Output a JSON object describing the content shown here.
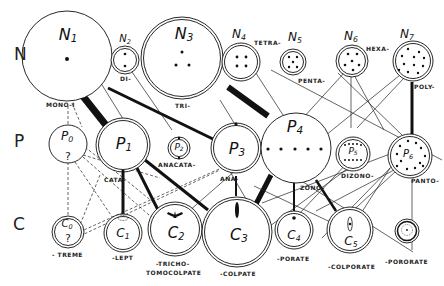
{
  "diagram": {
    "rows": [
      {
        "key": "N",
        "label": "N",
        "meaning": "number of apertures"
      },
      {
        "key": "P",
        "label": "P",
        "meaning": "position of apertures"
      },
      {
        "key": "C",
        "label": "C",
        "meaning": "character of apertures"
      }
    ],
    "nodes": {
      "N": [
        {
          "id": "N1",
          "letter": "N",
          "sub": "1",
          "prefix": "MONO-I"
        },
        {
          "id": "N2",
          "letter": "N",
          "sub": "2",
          "prefix": "DI-"
        },
        {
          "id": "N3",
          "letter": "N",
          "sub": "3",
          "prefix": "TRI-"
        },
        {
          "id": "N4",
          "letter": "N",
          "sub": "4",
          "prefix": "TETRA-"
        },
        {
          "id": "N5",
          "letter": "N",
          "sub": "5",
          "prefix": "PENTA-"
        },
        {
          "id": "N6",
          "letter": "N",
          "sub": "6",
          "prefix": "HEXA-"
        },
        {
          "id": "N7",
          "letter": "N",
          "sub": "7",
          "prefix": "POLY-"
        }
      ],
      "P": [
        {
          "id": "P0",
          "letter": "P",
          "sub": "0",
          "prefix": "",
          "mark": "?"
        },
        {
          "id": "P1",
          "letter": "P",
          "sub": "1",
          "prefix": "CATA-"
        },
        {
          "id": "P2",
          "letter": "P",
          "sub": "2",
          "prefix": "ANACATA-"
        },
        {
          "id": "P3",
          "letter": "P",
          "sub": "3",
          "prefix": "ANA-"
        },
        {
          "id": "P4",
          "letter": "P",
          "sub": "4",
          "prefix": "ZONO-"
        },
        {
          "id": "P5",
          "letter": "P",
          "sub": "5",
          "prefix": "DIZONO-"
        },
        {
          "id": "P6",
          "letter": "P",
          "sub": "6",
          "prefix": "PANTO-"
        }
      ],
      "C": [
        {
          "id": "C0",
          "letter": "C",
          "sub": "0",
          "suffix": "- TREME",
          "mark": "?"
        },
        {
          "id": "C1",
          "letter": "C",
          "sub": "1",
          "suffix": "-LEPT"
        },
        {
          "id": "C2",
          "letter": "C",
          "sub": "2",
          "suffix": "-TRICHO-",
          "suffix2": "TOMOCOLPATE"
        },
        {
          "id": "C3",
          "letter": "C",
          "sub": "3",
          "suffix": "-COLPATE"
        },
        {
          "id": "C4",
          "letter": "C",
          "sub": "4",
          "suffix": "-PORATE"
        },
        {
          "id": "C5",
          "letter": "C",
          "sub": "5",
          "suffix": "-COLPORATE"
        },
        {
          "id": "C6",
          "letter": "C",
          "sub": "6",
          "suffix": "-PORORATE"
        }
      ]
    },
    "colors": {
      "ink": "#111111",
      "background": "#ffffff"
    }
  }
}
